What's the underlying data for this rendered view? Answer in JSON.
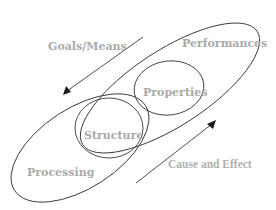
{
  "diagram": {
    "title": "",
    "nodes": {
      "performances": "Performances",
      "properties": "Properties",
      "structure": "Structure",
      "processing": "Processing"
    },
    "arrows": {
      "goals_means": "Goals/Means",
      "cause_effect": "Cause and Effect"
    },
    "colors": {
      "label": "#a9a9a9",
      "stroke": "#3a3a3a",
      "arrowhead": "#1a1a1a",
      "background": "#ffffff"
    }
  }
}
